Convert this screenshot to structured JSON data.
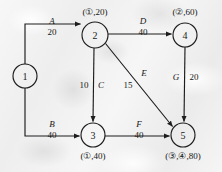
{
  "figure": {
    "kind": "network-flow-diagram",
    "background_color": "#f1f1f1",
    "ink_color": "#1d1d1d"
  },
  "nodes": [
    {
      "id": "1",
      "label": "1",
      "cx": 25,
      "cy": 76,
      "r": 12,
      "annotation": "",
      "annotation_pos": "none"
    },
    {
      "id": "2",
      "label": "2",
      "cx": 95,
      "cy": 35,
      "r": 13,
      "annotation": "(①,20)",
      "annotation_pos": "above"
    },
    {
      "id": "3",
      "label": "3",
      "cx": 93,
      "cy": 135,
      "r": 12,
      "annotation": "(①,40)",
      "annotation_pos": "below"
    },
    {
      "id": "4",
      "label": "4",
      "cx": 185,
      "cy": 35,
      "r": 12,
      "annotation": "(②,60)",
      "annotation_pos": "above"
    },
    {
      "id": "5",
      "label": "5",
      "cx": 183,
      "cy": 135,
      "r": 12,
      "annotation": "(③,④,80)",
      "annotation_pos": "below"
    }
  ],
  "edges": [
    {
      "id": "A",
      "from": "1",
      "to": "2",
      "label": "A",
      "weight": "20",
      "label_x": 52,
      "label_y": 24,
      "weight_x": 52,
      "weight_y": 35
    },
    {
      "id": "B",
      "from": "1",
      "to": "3",
      "label": "B",
      "weight": "40",
      "label_x": 52,
      "label_y": 127,
      "weight_x": 52,
      "weight_y": 138
    },
    {
      "id": "C",
      "from": "2",
      "to": "3",
      "label": "C",
      "weight": "10",
      "label_x": 101,
      "label_y": 88,
      "weight_x": 84,
      "weight_y": 88
    },
    {
      "id": "D",
      "from": "2",
      "to": "4",
      "label": "D",
      "weight": "40",
      "label_x": 143,
      "label_y": 24,
      "weight_x": 143,
      "weight_y": 35
    },
    {
      "id": "E",
      "from": "2",
      "to": "5",
      "label": "E",
      "weight": "15",
      "label_x": 144,
      "label_y": 76,
      "weight_x": 128,
      "weight_y": 88
    },
    {
      "id": "F",
      "from": "3",
      "to": "5",
      "label": "F",
      "weight": "40",
      "label_x": 139,
      "label_y": 127,
      "weight_x": 139,
      "weight_y": 138
    },
    {
      "id": "G",
      "from": "4",
      "to": "5",
      "label": "G",
      "weight": "20",
      "label_x": 176,
      "label_y": 80,
      "weight_x": 194,
      "weight_y": 80
    }
  ]
}
